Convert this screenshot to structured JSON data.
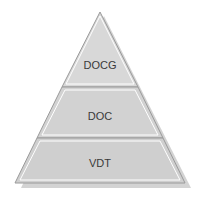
{
  "diagram": {
    "type": "pyramid",
    "colors": {
      "fill": "#d2d2d2",
      "fill_top": "#d8d8d8",
      "outline": "#9a9a9a",
      "inner_line": "#ffffff",
      "shadow": "#b8b8b8",
      "text": "#3a3a3a"
    },
    "tiers": [
      {
        "label": "DOCG"
      },
      {
        "label": "DOC"
      },
      {
        "label": "VDT"
      }
    ]
  }
}
